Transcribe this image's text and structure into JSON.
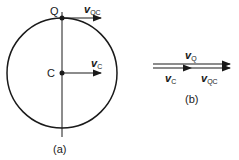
{
  "diagram_a": {
    "point_top": "Q",
    "point_center": "C",
    "vector_top": {
      "symbol": "v",
      "subscript": "QC"
    },
    "vector_center": {
      "symbol": "v",
      "subscript": "C"
    },
    "caption": "(a)"
  },
  "diagram_b": {
    "vector_sum": {
      "symbol": "v",
      "subscript": "Q"
    },
    "vector_first": {
      "symbol": "v",
      "subscript": "C"
    },
    "vector_second": {
      "symbol": "v",
      "subscript": "QC"
    },
    "caption": "(b)"
  }
}
